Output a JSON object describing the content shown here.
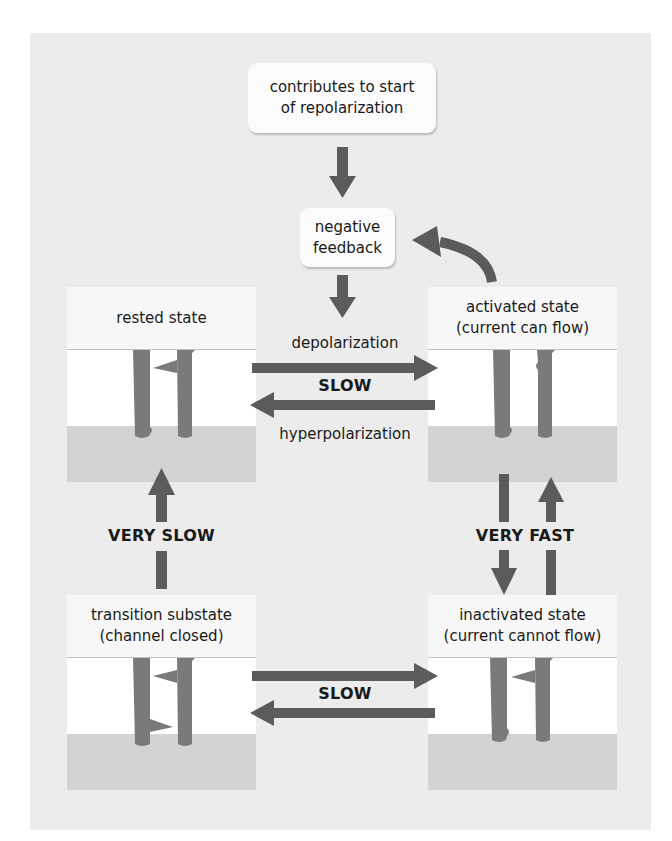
{
  "colors": {
    "arrow": "#5b5b5b",
    "pillar": "#7a7a7a",
    "panel_bg": "#ececec",
    "cytoplasm": "#d3d3d3"
  },
  "notes": {
    "top": {
      "line1": "contributes to start",
      "line2": "of repolarization"
    },
    "feedback": {
      "line1": "negative",
      "line2": "feedback"
    }
  },
  "states": {
    "rested": {
      "line1": "rested state",
      "line2": ""
    },
    "activated": {
      "line1": "activated state",
      "line2": "(current can flow)"
    },
    "transition": {
      "line1": "transition substate",
      "line2": "(channel closed)"
    },
    "inactivated": {
      "line1": "inactivated state",
      "line2": "(current cannot flow)"
    }
  },
  "transitions": {
    "rested_activated": {
      "forward": "depolarization",
      "speed": "SLOW",
      "backward": "hyperpolarization"
    },
    "transition_rested": {
      "speed": "VERY SLOW"
    },
    "activated_inactivated": {
      "speed": "VERY FAST"
    },
    "transition_inactivated": {
      "speed": "SLOW"
    }
  }
}
